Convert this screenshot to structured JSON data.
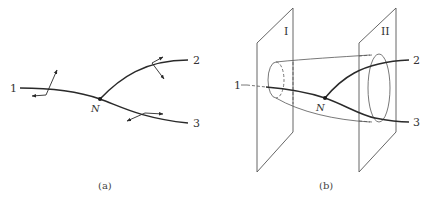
{
  "figure": {
    "panel_a": {
      "caption": "(a)",
      "branch_labels": [
        "1",
        "2",
        "3"
      ],
      "node_label": "N"
    },
    "panel_b": {
      "caption": "(b)",
      "plane_labels": [
        "I",
        "II"
      ],
      "branch_labels": [
        "1",
        "2",
        "3"
      ],
      "node_label": "N"
    },
    "colors": {
      "line": "#2a2a2a",
      "thin_line": "#555555",
      "background": "#ffffff"
    }
  }
}
